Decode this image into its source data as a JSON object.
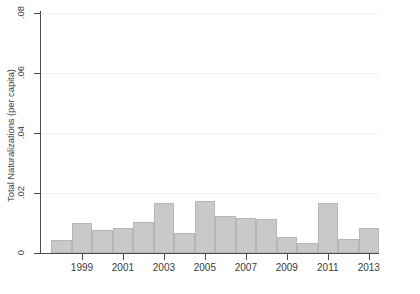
{
  "chart_data": {
    "type": "bar",
    "title": "",
    "xlabel": "",
    "ylabel": "Total Naturalizations (per capita)",
    "ylim": [
      0,
      0.08
    ],
    "xlim": [
      1997.5,
      2014.0
    ],
    "grid": false,
    "legend": null,
    "bar_color": "#c9c9c9",
    "bar_edge_color": "#b6b6b6",
    "axis_color": "#4d4d4d",
    "ytick_labels": [
      "0",
      ".02",
      ".04",
      ".06",
      ".08"
    ],
    "ytick_values": [
      0,
      0.02,
      0.04,
      0.06,
      0.08
    ],
    "xtick_labels": [
      "1999",
      "2001",
      "2003",
      "2005",
      "2007",
      "2009",
      "2011",
      "2013"
    ],
    "xtick_values": [
      1999,
      2001,
      2003,
      2005,
      2007,
      2009,
      2011,
      2013
    ],
    "categories": [
      "1998",
      "1999",
      "2000",
      "2001",
      "2002",
      "2003",
      "2004",
      "2005",
      "2006",
      "2007",
      "2008",
      "2009",
      "2010",
      "2011",
      "2012",
      "2013"
    ],
    "values": [
      0.0042,
      0.01,
      0.0078,
      0.0085,
      0.0102,
      0.0167,
      0.0068,
      0.0175,
      0.0125,
      0.0118,
      0.0112,
      0.0055,
      0.0035,
      0.0168,
      0.0048,
      0.0085
    ]
  }
}
